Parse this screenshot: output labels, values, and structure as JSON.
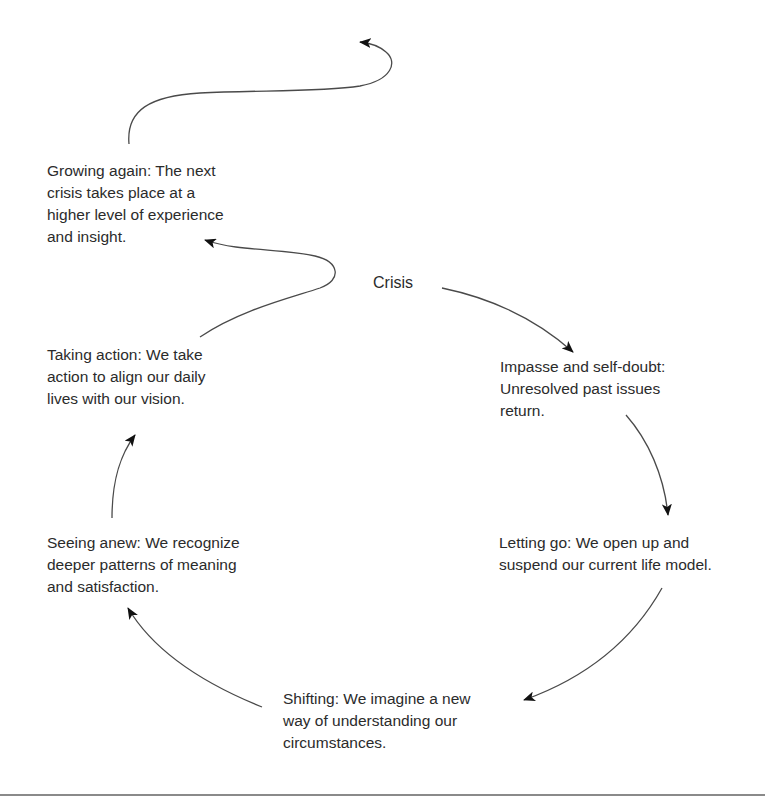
{
  "diagram": {
    "type": "cycle",
    "center_label": "Crisis",
    "stages": [
      {
        "id": "impasse",
        "lines": [
          "Impasse and self-doubt:",
          "Unresolved past issues",
          "return."
        ]
      },
      {
        "id": "letting-go",
        "lines": [
          "Letting go: We open up and",
          "suspend our current life model."
        ]
      },
      {
        "id": "shifting",
        "lines": [
          "Shifting: We imagine a new",
          "way of understanding our",
          "circumstances."
        ]
      },
      {
        "id": "seeing-anew",
        "lines": [
          "Seeing anew: We recognize",
          "deeper patterns of meaning",
          "and satisfaction."
        ]
      },
      {
        "id": "taking-action",
        "lines": [
          "Taking action: We take",
          "action to align our daily",
          "lives with our vision."
        ]
      },
      {
        "id": "growing-again",
        "lines": [
          "Growing again: The next",
          "crisis takes place at a",
          "higher level of experience",
          "and insight."
        ]
      }
    ],
    "arrows": [
      {
        "from": "crisis",
        "to": "impasse"
      },
      {
        "from": "impasse",
        "to": "letting-go"
      },
      {
        "from": "letting-go",
        "to": "shifting"
      },
      {
        "from": "shifting",
        "to": "seeing-anew"
      },
      {
        "from": "seeing-anew",
        "to": "taking-action"
      },
      {
        "from": "taking-action",
        "to": "growing-again"
      },
      {
        "from": "growing-again",
        "to": "next-cycle"
      }
    ],
    "colors": {
      "text": "#2b2b2b",
      "line": "#4a4a4a",
      "arrowhead": "#111111",
      "rule": "#8a8a8a",
      "background": "#ffffff"
    }
  }
}
